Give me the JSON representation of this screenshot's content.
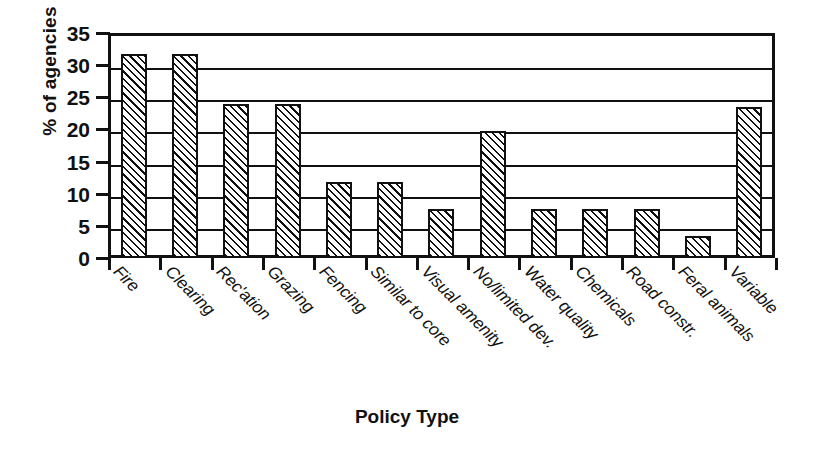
{
  "chart_data": {
    "type": "bar",
    "title": "",
    "xlabel": "Policy Type",
    "ylabel": "% of agencies",
    "categories": [
      "Fire",
      "Clearing",
      "Rec'ation",
      "Grazing",
      "Fencing",
      "Similar to core",
      "Visual amenity",
      "No/limited dev.",
      "Water quality",
      "Chemicals",
      "Road constr.",
      "Feral animals",
      "Variable"
    ],
    "values": [
      31.8,
      31.8,
      23.9,
      23.9,
      11.8,
      11.8,
      7.7,
      19.7,
      7.6,
      7.6,
      7.6,
      3.5,
      23.5
    ],
    "ylim": [
      0,
      35
    ],
    "ytick_labels": [
      "0",
      "5",
      "10",
      "15",
      "20",
      "25",
      "30",
      "35"
    ],
    "ytick_values": [
      0,
      5,
      10,
      15,
      20,
      25,
      30,
      35
    ],
    "grid": true,
    "legend": false,
    "bar_fill": "diagonal-hatch",
    "colors": {
      "axis": "#111111",
      "bar_stroke": "#111111",
      "bar_fill": "#ffffff",
      "gridline": "#111111",
      "background": "#ffffff"
    }
  }
}
